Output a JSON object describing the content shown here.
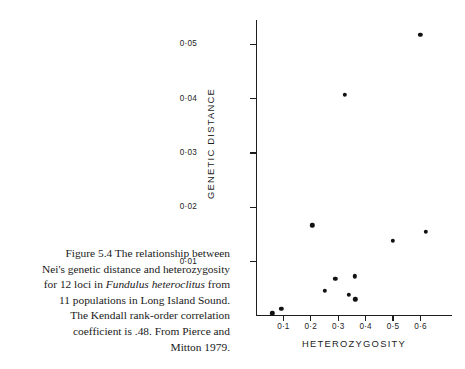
{
  "caption": {
    "lines": [
      {
        "segments": [
          {
            "text": "Figure 5.4  The relationship between",
            "style": "normal"
          }
        ]
      },
      {
        "segments": [
          {
            "text": "Nei's genetic distance and heterozygosity",
            "style": "normal"
          }
        ]
      },
      {
        "segments": [
          {
            "text": "for 12 loci in ",
            "style": "normal"
          },
          {
            "text": "Fundulus heteroclitus",
            "style": "italic"
          },
          {
            "text": " from",
            "style": "normal"
          }
        ]
      },
      {
        "segments": [
          {
            "text": "11 populations in Long Island Sound.",
            "style": "normal"
          }
        ]
      },
      {
        "segments": [
          {
            "text": "The Kendall rank-order correlation",
            "style": "normal"
          }
        ]
      },
      {
        "segments": [
          {
            "text": "coefficient is .48. From Pierce and",
            "style": "normal"
          }
        ]
      },
      {
        "segments": [
          {
            "text": "Mitton 1979.",
            "style": "normal"
          }
        ]
      }
    ]
  },
  "chart_data": {
    "type": "scatter",
    "title": "",
    "xlabel": "HETEROZYGOSITY",
    "ylabel": "GENETIC  DISTANCE",
    "xlim": [
      0.0,
      0.715
    ],
    "ylim": [
      0.0,
      0.0545
    ],
    "grid": false,
    "legend": null,
    "xticks": [
      0.1,
      0.2,
      0.3,
      0.4,
      0.5,
      0.6
    ],
    "xtick_labels": [
      "0·1",
      "0·2",
      "0·3",
      "0·4",
      "0·5",
      "0·6"
    ],
    "yticks": [
      0.01,
      0.02,
      0.03,
      0.04,
      0.05
    ],
    "ytick_labels": [
      "0·01",
      "0·02",
      "0·03",
      "0·04",
      "0·05"
    ],
    "marker": "filled-circle",
    "marker_color": "#111111",
    "n_points": 12,
    "x": [
      0.06,
      0.092,
      0.205,
      0.25,
      0.29,
      0.325,
      0.338,
      0.36,
      0.362,
      0.5,
      0.6,
      0.62
    ],
    "y": [
      0.0005,
      0.0013,
      0.0167,
      0.0046,
      0.0068,
      0.0407,
      0.0039,
      0.0073,
      0.0031,
      0.0138,
      0.0518,
      0.0155
    ],
    "points": [
      {
        "x": 0.06,
        "y": 0.0005
      },
      {
        "x": 0.092,
        "y": 0.0013
      },
      {
        "x": 0.205,
        "y": 0.0167
      },
      {
        "x": 0.25,
        "y": 0.0046
      },
      {
        "x": 0.29,
        "y": 0.0068
      },
      {
        "x": 0.325,
        "y": 0.0407
      },
      {
        "x": 0.338,
        "y": 0.0039
      },
      {
        "x": 0.36,
        "y": 0.0073
      },
      {
        "x": 0.362,
        "y": 0.0031
      },
      {
        "x": 0.5,
        "y": 0.0138
      },
      {
        "x": 0.6,
        "y": 0.0518
      },
      {
        "x": 0.62,
        "y": 0.0155
      }
    ]
  }
}
